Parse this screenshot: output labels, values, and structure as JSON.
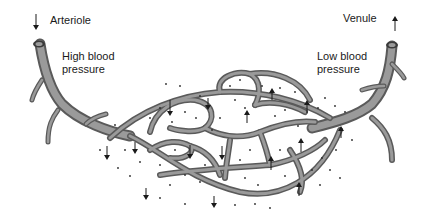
{
  "diagram": {
    "labels": {
      "arteriole": "Arteriole",
      "high_pressure_line1": "High blood",
      "high_pressure_line2": "pressure",
      "venule": "Venule",
      "low_pressure_line1": "Low blood",
      "low_pressure_line2": "pressure"
    },
    "icons": {
      "inflow": "arrow-down-icon",
      "outflow": "arrow-up-icon",
      "filtration_arrows": "arrow-down-icon",
      "reabsorption_arrows": "arrow-up-icon"
    },
    "colors": {
      "vessel_outline": "#5a5a5a",
      "vessel_fill": "#9a9a9a",
      "text": "#1a1a1a",
      "background": "#ffffff"
    }
  }
}
